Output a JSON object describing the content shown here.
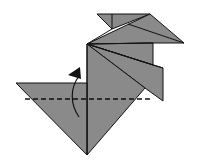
{
  "diagram": {
    "type": "origami-fold-step",
    "colors": {
      "paper": "#8a8a8a",
      "edge": "#111111",
      "background": "#ffffff"
    },
    "fold_line": {
      "style": "valley-dashed",
      "y": 99,
      "x1": 25,
      "x2": 150
    },
    "arrow": {
      "direction": "up",
      "meaning": "fold-up"
    }
  }
}
